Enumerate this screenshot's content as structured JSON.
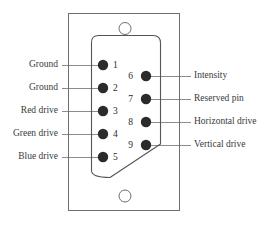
{
  "diagram": {
    "colors": {
      "outline": "#6e6e6e",
      "shell_outline": "#555555",
      "pin_fill": "#2b2b2b",
      "leader_line": "#8c8c8c",
      "text": "#3a3a3a",
      "background": "#ffffff"
    },
    "connector": {
      "shell_name": "d-sub-shell",
      "mounting_holes": [
        {
          "name": "top-mounting-hole"
        },
        {
          "name": "bottom-mounting-hole"
        }
      ]
    },
    "pins_left": [
      {
        "number": "1",
        "label": "Ground"
      },
      {
        "number": "2",
        "label": "Ground"
      },
      {
        "number": "3",
        "label": "Red drive"
      },
      {
        "number": "4",
        "label": "Green drive"
      },
      {
        "number": "5",
        "label": "Blue drive"
      }
    ],
    "pins_right": [
      {
        "number": "6",
        "label": "Intensity"
      },
      {
        "number": "7",
        "label": "Reserved pin"
      },
      {
        "number": "8",
        "label": "Horizontal drive"
      },
      {
        "number": "9",
        "label": "Vertical drive"
      }
    ]
  }
}
